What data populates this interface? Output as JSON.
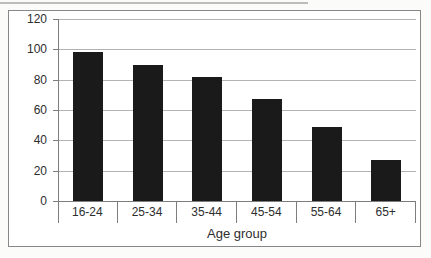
{
  "chart_data": {
    "type": "bar",
    "title": "",
    "xlabel": "Age group",
    "ylabel": "",
    "categories": [
      "16-24",
      "25-34",
      "35-44",
      "45-54",
      "55-64",
      "65+"
    ],
    "values": [
      98,
      90,
      82,
      67,
      49,
      27
    ],
    "ylim": [
      0,
      120
    ],
    "yticks": [
      0,
      20,
      40,
      60,
      80,
      100,
      120
    ],
    "grid": true,
    "legend": false,
    "bar_color": "#1a1a1a",
    "gridline_color": "#b3b3b3",
    "axis_color": "#7d7d7d",
    "text_color": "#2e2e2e",
    "frame_border_color": "#878787"
  }
}
